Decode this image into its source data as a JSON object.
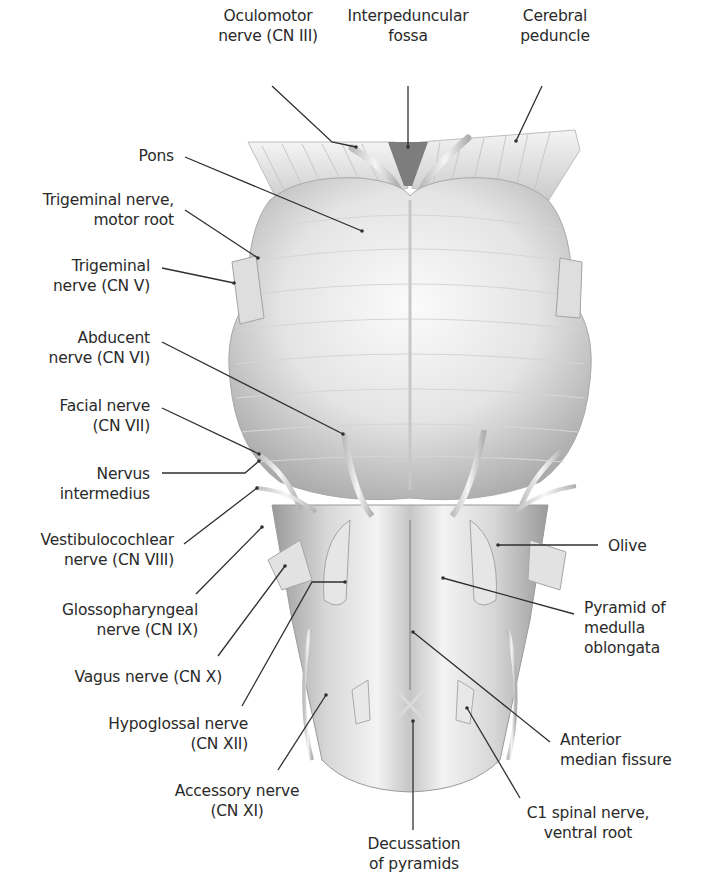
{
  "figure": {
    "colors": {
      "background": "#ffffff",
      "text": "#2a2a2a",
      "leader": "#2f2f2f",
      "tissue_light": "#f2f2f2",
      "tissue_mid": "#cfcfcf",
      "tissue_dark": "#8a8a8a"
    }
  },
  "labels": {
    "oculomotor": {
      "lines": [
        "Oculomotor",
        "nerve (CN III)"
      ],
      "x": 208,
      "y": 6,
      "w": 120,
      "align": "center",
      "anchor": [
        356,
        147
      ]
    },
    "interpeduncular": {
      "lines": [
        "Interpeduncular",
        "fossa"
      ],
      "x": 340,
      "y": 6,
      "w": 136,
      "align": "center",
      "anchor": [
        408,
        147
      ]
    },
    "cerebral_peduncle": {
      "lines": [
        "Cerebral",
        "peduncle"
      ],
      "x": 500,
      "y": 6,
      "w": 110,
      "align": "center",
      "anchor": [
        516,
        141
      ]
    },
    "pons": {
      "lines": [
        "Pons"
      ],
      "x": 60,
      "y": 146,
      "w": 114,
      "align": "right",
      "anchor": [
        362,
        231
      ]
    },
    "trigeminal_motor": {
      "lines": [
        "Trigeminal nerve,",
        "motor root"
      ],
      "x": 20,
      "y": 190,
      "w": 154,
      "align": "right",
      "anchor": [
        258,
        258
      ]
    },
    "trigeminal": {
      "lines": [
        "Trigeminal",
        "nerve (CN V)"
      ],
      "x": 30,
      "y": 256,
      "w": 120,
      "align": "right",
      "anchor": [
        234,
        283
      ]
    },
    "abducent": {
      "lines": [
        "Abducent",
        "nerve (CN VI)"
      ],
      "x": 30,
      "y": 328,
      "w": 120,
      "align": "right",
      "anchor": [
        343,
        434
      ]
    },
    "facial": {
      "lines": [
        "Facial nerve",
        "(CN VII)"
      ],
      "x": 30,
      "y": 396,
      "w": 120,
      "align": "right",
      "anchor": [
        259,
        454
      ]
    },
    "intermedius": {
      "lines": [
        "Nervus",
        "intermedius"
      ],
      "x": 30,
      "y": 464,
      "w": 120,
      "align": "right",
      "anchor": [
        259,
        461
      ]
    },
    "vestibulocochlear": {
      "lines": [
        "Vestibulocochlear",
        "nerve (CN VIII)"
      ],
      "x": 10,
      "y": 530,
      "w": 164,
      "align": "right",
      "anchor": [
        257,
        488
      ]
    },
    "glossopharyngeal": {
      "lines": [
        "Glossopharyngeal",
        "nerve (CN IX)"
      ],
      "x": 30,
      "y": 600,
      "w": 168,
      "align": "right",
      "anchor": [
        262,
        527
      ]
    },
    "vagus": {
      "lines": [
        "Vagus nerve (CN X)"
      ],
      "x": 50,
      "y": 667,
      "w": 172,
      "align": "right",
      "anchor": [
        285,
        566
      ]
    },
    "hypoglossal": {
      "lines": [
        "Hypoglossal nerve",
        "(CN XII)"
      ],
      "x": 80,
      "y": 714,
      "w": 168,
      "align": "right",
      "anchor": [
        345,
        565
      ]
    },
    "accessory": {
      "lines": [
        "Accessory nerve",
        "(CN XI)"
      ],
      "x": 165,
      "y": 781,
      "w": 144,
      "align": "center",
      "anchor": [
        326,
        695
      ]
    },
    "decussation": {
      "lines": [
        "Decussation",
        "of pyramids"
      ],
      "x": 352,
      "y": 834,
      "w": 124,
      "align": "center",
      "anchor": [
        413,
        721
      ]
    },
    "c1": {
      "lines": [
        "C1 spinal nerve,",
        "ventral root"
      ],
      "x": 508,
      "y": 803,
      "w": 160,
      "align": "center",
      "anchor": [
        467,
        708
      ]
    },
    "olive": {
      "lines": [
        "Olive"
      ],
      "x": 608,
      "y": 536,
      "w": 80,
      "align": "left",
      "anchor": [
        498,
        545
      ]
    },
    "pyramid": {
      "lines": [
        "Pyramid of",
        "medulla",
        "oblongata"
      ],
      "x": 584,
      "y": 598,
      "w": 110,
      "align": "left",
      "anchor": [
        443,
        578
      ]
    },
    "anterior_median": {
      "lines": [
        "Anterior",
        "median fissure"
      ],
      "x": 560,
      "y": 730,
      "w": 140,
      "align": "left",
      "anchor": [
        413,
        632
      ]
    }
  }
}
